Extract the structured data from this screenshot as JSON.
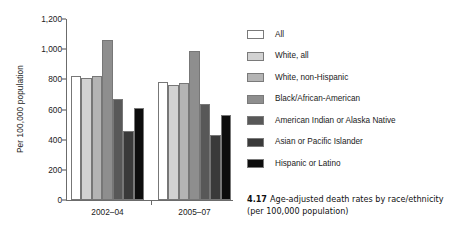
{
  "chart_data": {
    "type": "bar",
    "title": "",
    "xlabel": "",
    "ylabel": "Per 100,000 population",
    "ylim": [
      0,
      1200
    ],
    "yticks": [
      "0",
      "200",
      "400",
      "600",
      "800",
      "1,000",
      "1,200"
    ],
    "ytick_values": [
      0,
      200,
      400,
      600,
      800,
      1000,
      1200
    ],
    "grid": false,
    "legend_position": "right",
    "categories": [
      "2002–04",
      "2005–07"
    ],
    "series": [
      {
        "name": "All",
        "values": [
          825,
          780
        ],
        "color": "#ffffff"
      },
      {
        "name": "White, all",
        "values": [
          808,
          765
        ],
        "color": "#d2d2d2"
      },
      {
        "name": "White, non-Hispanic",
        "values": [
          820,
          778
        ],
        "color": "#b4b4b4"
      },
      {
        "name": "Black/African-American",
        "values": [
          1059,
          985
        ],
        "color": "#8e8e8e"
      },
      {
        "name": "American Indian or Alaska Native",
        "values": [
          668,
          638
        ],
        "color": "#585858"
      },
      {
        "name": "Asian or Pacific Islander",
        "values": [
          458,
          428
        ],
        "color": "#3a3a3a"
      },
      {
        "name": "Hispanic or Latino",
        "values": [
          610,
          565
        ],
        "color": "#0d0d0d"
      }
    ]
  },
  "caption": {
    "number": "4.17",
    "line1": "Age-adjusted death rates by race/ethnicity",
    "line2": "(per 100,000 population)"
  }
}
